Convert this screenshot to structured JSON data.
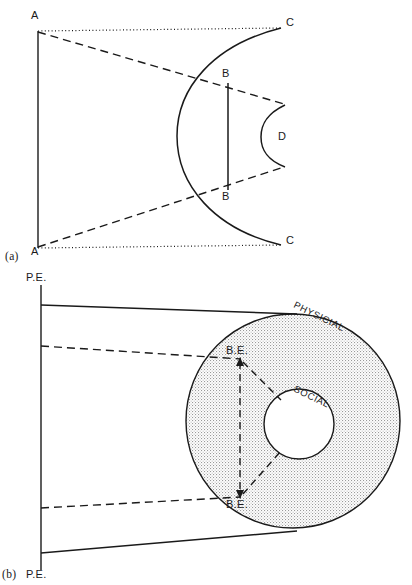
{
  "figure": {
    "caption_a": "(a)",
    "caption_b": "(b)",
    "panel_a": {
      "label_A_top": "A",
      "label_A_bottom": "A",
      "label_C_top": "C",
      "label_C_bottom": "C",
      "label_B_top": "B",
      "label_B_bottom": "B",
      "label_D": "D"
    },
    "panel_b": {
      "label_PE_top": "P.E.",
      "label_PE_bottom": "P.E.",
      "label_BE_top": "B.E.",
      "label_BE_bottom": "B.E.",
      "label_physical": "PHYSICIAL",
      "label_social": "SOCIAL"
    }
  },
  "style": {
    "ink": "#1a1a1a",
    "stipple": "#9a9a9a",
    "background": "#ffffff"
  }
}
